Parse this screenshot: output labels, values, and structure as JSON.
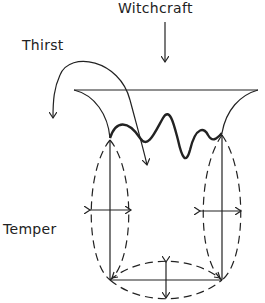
{
  "labels": {
    "top": "Witchcraft",
    "left_top": "Thirst",
    "left_middle": "Temper"
  },
  "colors": {
    "line": "#222222",
    "background": "#ffffff"
  }
}
